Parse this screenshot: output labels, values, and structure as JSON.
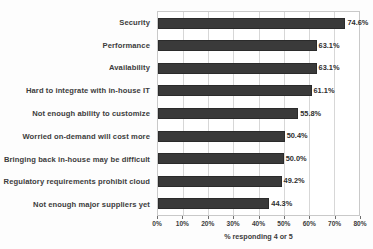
{
  "chart_data": {
    "type": "bar",
    "orientation": "horizontal",
    "title": "",
    "xlabel": "% responding 4 or 5",
    "ylabel": "",
    "xlim": [
      0,
      80
    ],
    "xtick_labels": [
      "0%",
      "10%",
      "20%",
      "30%",
      "40%",
      "50%",
      "60%",
      "70%",
      "80%"
    ],
    "xticks": [
      0,
      10,
      20,
      30,
      40,
      50,
      60,
      70,
      80
    ],
    "grid": true,
    "legend": false,
    "bar_color": "#3a3a3a",
    "categories": [
      "Security",
      "Performance",
      "Availability",
      "Hard to integrate with in-house IT",
      "Not enough ability to customize",
      "Worried on-demand will cost more",
      "Bringing back in-house may be difficult",
      "Regulatory requirements prohibit cloud",
      "Not enough major suppliers yet"
    ],
    "values": [
      74.6,
      63.1,
      63.1,
      61.1,
      55.8,
      50.4,
      50.0,
      49.2,
      44.3
    ],
    "value_labels": [
      "74.6%",
      "63.1%",
      "63.1%",
      "61.1%",
      "55.8%",
      "50.4%",
      "50.0%",
      "49.2%",
      "44.3%"
    ]
  }
}
